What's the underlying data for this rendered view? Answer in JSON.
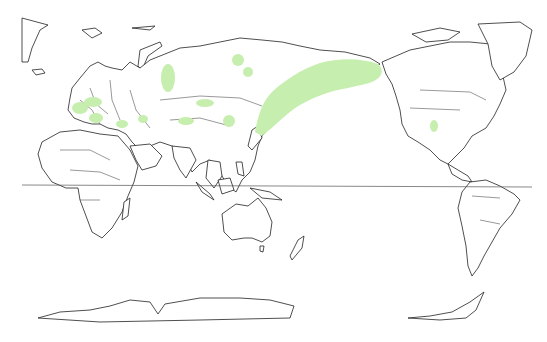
{
  "map": {
    "projection": "Pacific-centered world map",
    "equator_y": 185,
    "colors": {
      "background": "#ffffff",
      "land_outline": "#222222",
      "range_fill": "#c6eeae",
      "equator": "#555555"
    },
    "ranges": [
      {
        "name": "western-europe-1",
        "cx": 80,
        "cy": 108,
        "rx": 8,
        "ry": 6
      },
      {
        "name": "central-europe",
        "cx": 93,
        "cy": 102,
        "rx": 9,
        "ry": 5
      },
      {
        "name": "italy-balkans",
        "cx": 96,
        "cy": 118,
        "rx": 7,
        "ry": 5
      },
      {
        "name": "black-sea",
        "cx": 122,
        "cy": 124,
        "rx": 6,
        "ry": 4
      },
      {
        "name": "caucasus",
        "cx": 143,
        "cy": 119,
        "rx": 5,
        "ry": 4
      },
      {
        "name": "west-siberia",
        "cx": 168,
        "cy": 78,
        "rx": 7,
        "ry": 14
      },
      {
        "name": "north-siberia-1",
        "cx": 238,
        "cy": 60,
        "rx": 6,
        "ry": 6
      },
      {
        "name": "north-siberia-2",
        "cx": 248,
        "cy": 72,
        "rx": 5,
        "ry": 5
      },
      {
        "name": "kazakhstan",
        "cx": 205,
        "cy": 103,
        "rx": 9,
        "ry": 4
      },
      {
        "name": "central-asia",
        "cx": 186,
        "cy": 121,
        "rx": 8,
        "ry": 4
      },
      {
        "name": "mongolia",
        "cx": 229,
        "cy": 121,
        "rx": 6,
        "ry": 6
      },
      {
        "name": "us-midwest",
        "cx": 434,
        "cy": 126,
        "rx": 4,
        "ry": 6
      }
    ],
    "main_range_path": "M255,130 C258,115 262,100 272,90 C285,78 300,68 320,62 C340,58 360,58 378,64 C385,70 382,78 372,82 C360,86 345,88 330,92 C312,98 300,104 290,110 C280,118 270,128 262,134 Z"
  }
}
